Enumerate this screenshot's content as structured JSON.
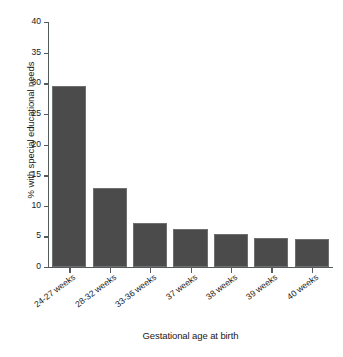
{
  "chart_data": {
    "type": "bar",
    "title": "",
    "xlabel": "Gestational age at birth",
    "ylabel": "% with special educational needs",
    "categories": [
      "24-27 weeks",
      "28-32 weeks",
      "33-36 weeks",
      "37 weeks",
      "38 weeks",
      "39 weeks",
      "40 weeks"
    ],
    "values": [
      29.6,
      12.9,
      7.2,
      6.2,
      5.4,
      4.8,
      4.6
    ],
    "ylim": [
      0,
      40
    ],
    "yticks": [
      0,
      5,
      10,
      15,
      20,
      25,
      30,
      35,
      40
    ],
    "ytick_labels": [
      "0",
      "5",
      "10",
      "15",
      "20",
      "25",
      "30",
      "35",
      "40"
    ],
    "grid": false,
    "legend": "none",
    "bar_color": "#4b4b4b",
    "bar_edge_color": "#6f6f6f",
    "axis_color": "#555a5d",
    "background_color": "#ffffff"
  }
}
